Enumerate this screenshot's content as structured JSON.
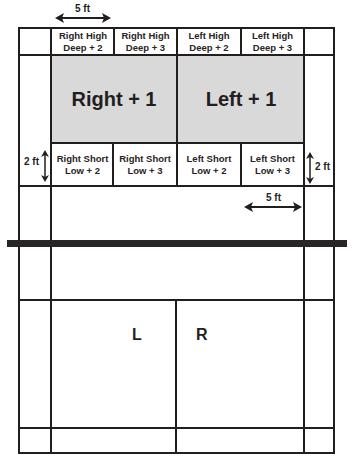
{
  "diagram": {
    "top_zones": [
      {
        "line1": "Right High",
        "line2": "Deep + 2"
      },
      {
        "line1": "Right High",
        "line2": "Deep + 3"
      },
      {
        "line1": "Left High",
        "line2": "Deep + 2"
      },
      {
        "line1": "Left High",
        "line2": "Deep + 3"
      }
    ],
    "mid_zones": [
      {
        "label": "Right + 1"
      },
      {
        "label": "Left + 1"
      }
    ],
    "short_zones": [
      {
        "line1": "Right Short",
        "line2": "Low + 2"
      },
      {
        "line1": "Right Short",
        "line2": "Low + 3"
      },
      {
        "line1": "Left Short",
        "line2": "Low + 2"
      },
      {
        "line1": "Left Short",
        "line2": "Low + 3"
      }
    ],
    "dimensions": {
      "top_width": "5 ft",
      "left_height": "2 ft",
      "right_height": "2 ft",
      "lower_width": "5 ft"
    },
    "receiving_side": {
      "left_label": "L",
      "right_label": "R"
    },
    "colors": {
      "line": "#231e1e",
      "zone_fill": "#d9d9d9",
      "background": "#ffffff"
    }
  }
}
